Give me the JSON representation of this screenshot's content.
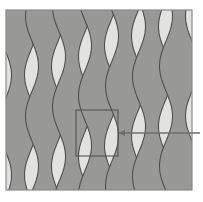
{
  "figure": {
    "kind": "micrograph-schematic",
    "canvas": {
      "width": 203,
      "height": 202
    },
    "frame": {
      "name": "image-frame",
      "x": 6,
      "y": 10,
      "width": 186,
      "height": 180,
      "border_color": "#8a8a8a",
      "border_width": 1.2,
      "background_color": "#e2e2e0"
    },
    "palette": {
      "background_light": "#e2e2e0",
      "band_dark": "#989897",
      "band_outline": "#4f4f4f",
      "frame_border": "#8a8a8a",
      "callout_box": "#555555",
      "callout_line": "#6e6e6e",
      "page_background": "#ffffff"
    },
    "pattern": {
      "description": "Alternating vertical light and dark wavy lamellae with sinusoidally varying width",
      "band_count": 7,
      "vertical_period": 100,
      "amplitude": 13,
      "nominal_band_width": 26,
      "outline_width": 1.1,
      "bands": [
        {
          "id": "band-1",
          "center_x": 18,
          "phase": 0.0,
          "fill": "#989897"
        },
        {
          "id": "band-2",
          "center_x": 45,
          "phase": 0.55,
          "fill": "#989897"
        },
        {
          "id": "band-3",
          "center_x": 72,
          "phase": 1.15,
          "fill": "#989897"
        },
        {
          "id": "band-4",
          "center_x": 98,
          "phase": 1.85,
          "fill": "#989897"
        },
        {
          "id": "band-5",
          "center_x": 125,
          "phase": 2.45,
          "fill": "#989897"
        },
        {
          "id": "band-6",
          "center_x": 152,
          "phase": 3.05,
          "fill": "#989897"
        },
        {
          "id": "band-7",
          "center_x": 179,
          "phase": 3.7,
          "fill": "#989897"
        }
      ]
    },
    "callout": {
      "name": "magnification-callout",
      "box": {
        "x": 76,
        "y": 110,
        "width": 42,
        "height": 46
      },
      "box_stroke": "#555555",
      "box_stroke_width": 1.1,
      "arrow": {
        "tail_x": 200,
        "tail_y": 133,
        "head_x": 119,
        "head_y": 133,
        "color": "#6e6e6e",
        "line_width": 1.3,
        "head_size": 6
      }
    }
  }
}
